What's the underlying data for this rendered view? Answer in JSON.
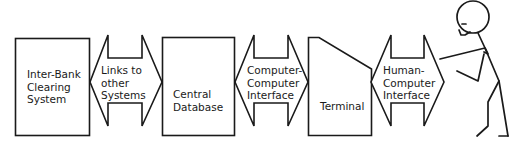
{
  "diagram": {
    "nodes": [
      {
        "id": "inter-bank-clearing-system",
        "type": "box",
        "label": "Inter-Bank\nClearing\nSystem"
      },
      {
        "id": "links-to-other-systems",
        "type": "double-arrow",
        "label": "Links to\nother\nSystems"
      },
      {
        "id": "central-database",
        "type": "box",
        "label": "Central\nDatabase"
      },
      {
        "id": "computer-computer-interface",
        "type": "double-arrow",
        "label": "Computer-\nComputer\nInterface"
      },
      {
        "id": "terminal",
        "type": "terminal",
        "label": "Terminal"
      },
      {
        "id": "human-computer-interface",
        "type": "double-arrow",
        "label": "Human-\nComputer\nInterface"
      },
      {
        "id": "user",
        "type": "stick-figure",
        "label": ""
      }
    ],
    "edges": [
      {
        "from": "inter-bank-clearing-system",
        "to": "central-database",
        "via": "links-to-other-systems",
        "direction": "both"
      },
      {
        "from": "central-database",
        "to": "terminal",
        "via": "computer-computer-interface",
        "direction": "both"
      },
      {
        "from": "terminal",
        "to": "user",
        "via": "human-computer-interface",
        "direction": "both"
      }
    ],
    "colors": {
      "stroke": "#1a1a1a",
      "fill": "#ffffff",
      "background": "#ffffff"
    }
  }
}
